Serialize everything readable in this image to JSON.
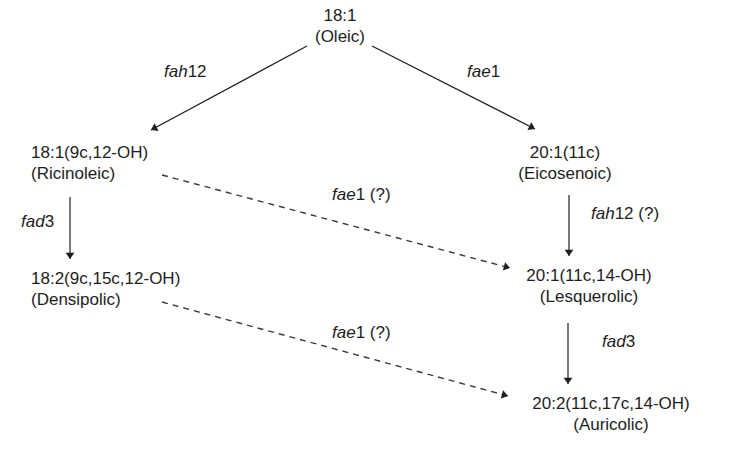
{
  "diagram": {
    "type": "biosynthetic-pathway",
    "nodes": [
      {
        "id": "oleic",
        "formula": "18:1",
        "name": "(Oleic)"
      },
      {
        "id": "ricinoleic",
        "formula": "18:1(9c,12-OH)",
        "name": "(Ricinoleic)"
      },
      {
        "id": "eicosenoic",
        "formula": "20:1(11c)",
        "name": "(Eicosenoic)"
      },
      {
        "id": "densipolic",
        "formula": "18:2(9c,15c,12-OH)",
        "name": "(Densipolic)"
      },
      {
        "id": "lesquerolic",
        "formula": "20:1(11c,14-OH)",
        "name": "(Lesquerolic)"
      },
      {
        "id": "auricolic",
        "formula": "20:2(11c,17c,14-OH)",
        "name": "(Auricolic)"
      }
    ],
    "edges": [
      {
        "from": "oleic",
        "to": "ricinoleic",
        "gene": "fah",
        "suffix": "12",
        "uncertain": "",
        "style": "solid"
      },
      {
        "from": "oleic",
        "to": "eicosenoic",
        "gene": "fae",
        "suffix": "1",
        "uncertain": "",
        "style": "solid"
      },
      {
        "from": "ricinoleic",
        "to": "densipolic",
        "gene": "fad",
        "suffix": "3",
        "uncertain": "",
        "style": "solid"
      },
      {
        "from": "eicosenoic",
        "to": "lesquerolic",
        "gene": "fah",
        "suffix": "12",
        "uncertain": " (?)",
        "style": "solid"
      },
      {
        "from": "ricinoleic",
        "to": "lesquerolic",
        "gene": "fae",
        "suffix": "1",
        "uncertain": " (?)",
        "style": "dashed"
      },
      {
        "from": "lesquerolic",
        "to": "auricolic",
        "gene": "fad",
        "suffix": "3",
        "uncertain": "",
        "style": "solid"
      },
      {
        "from": "densipolic",
        "to": "auricolic",
        "gene": "fae",
        "suffix": "1",
        "uncertain": " (?)",
        "style": "dashed"
      }
    ]
  },
  "colors": {
    "line": "#1e1e1e",
    "dashed": "#3a3a3a",
    "background": "#ffffff"
  }
}
